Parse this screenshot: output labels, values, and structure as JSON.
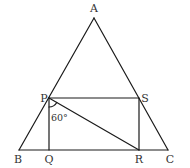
{
  "diagram": {
    "type": "geometry",
    "points": {
      "A": {
        "label": "A",
        "x": 94,
        "y": 18
      },
      "B": {
        "label": "B",
        "x": 19,
        "y": 150
      },
      "C": {
        "label": "C",
        "x": 168,
        "y": 150
      },
      "P": {
        "label": "P",
        "x": 49,
        "y": 98
      },
      "S": {
        "label": "S",
        "x": 139,
        "y": 98
      },
      "Q": {
        "label": "Q",
        "x": 49,
        "y": 150
      },
      "R": {
        "label": "R",
        "x": 139,
        "y": 150
      }
    },
    "segments": [
      "AB",
      "AC",
      "BC",
      "PS",
      "PQ",
      "SR",
      "PR"
    ],
    "angle": {
      "vertex": "P",
      "between": [
        "Q",
        "R"
      ],
      "label": "60°"
    }
  },
  "labels": {
    "A": "A",
    "B": "B",
    "C": "C",
    "P": "P",
    "Q": "Q",
    "R": "R",
    "S": "S",
    "angle": "60°"
  },
  "colors": {
    "stroke": "#1a1a1a",
    "text": "#333333",
    "background": "#ffffff"
  }
}
